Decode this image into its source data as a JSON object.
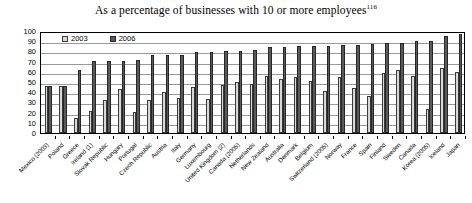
{
  "title": {
    "text": "As a percentage of businesses with 10 or more employees",
    "footnote": "116"
  },
  "legend": {
    "position": "top-left-inside",
    "items": [
      {
        "label": "2003",
        "color": "#d8d8d8",
        "border": "#3a3a3a"
      },
      {
        "label": "2006",
        "color": "#5a5a5a",
        "border": "#262626"
      }
    ]
  },
  "axes": {
    "y_ticks": [
      "100",
      "90",
      "80",
      "70",
      "60",
      "50",
      "40",
      "30",
      "20",
      "10",
      "0"
    ],
    "y_min": 0,
    "y_max": 100,
    "grid": true
  },
  "chart_data": {
    "type": "bar",
    "title": "As a percentage of businesses with 10 or more employees",
    "xlabel": "",
    "ylabel": "",
    "ylim": [
      0,
      100
    ],
    "grid": true,
    "legend_position": "upper left",
    "categories": [
      "Mexico (2003)",
      "Poland",
      "Greece",
      "Ireland (1)",
      "Slovak Republic",
      "Hungary",
      "Portugal",
      "Czech Republic",
      "Austria",
      "Italy",
      "Germany",
      "Luxembourg",
      "United Kingdom (2)",
      "Canada (2005)",
      "Netherlands",
      "New Zealand",
      "Australia",
      "Denmark",
      "Belgium",
      "Switzerland (2005)",
      "Norway",
      "France",
      "Spain",
      "Finland",
      "Sweden",
      "Canada",
      "Korea (2005)",
      "Iceland",
      "Japan"
    ],
    "series": [
      {
        "name": "2003",
        "color": "#d8d8d8",
        "values": [
          46,
          46,
          15,
          22,
          32,
          43,
          21,
          32,
          40,
          34,
          45,
          33,
          47,
          50,
          48,
          56,
          53,
          55,
          51,
          41,
          55,
          44,
          36,
          59,
          62,
          56,
          24,
          64,
          60
        ]
      },
      {
        "name": "2006",
        "color": "#5a5a5a",
        "values": [
          46,
          46,
          62,
          71,
          71,
          71,
          72,
          76,
          76,
          76,
          79,
          79,
          80,
          80,
          81,
          84,
          84,
          85,
          85,
          85,
          86,
          86,
          87,
          88,
          88,
          90,
          90,
          95,
          97
        ]
      }
    ]
  }
}
